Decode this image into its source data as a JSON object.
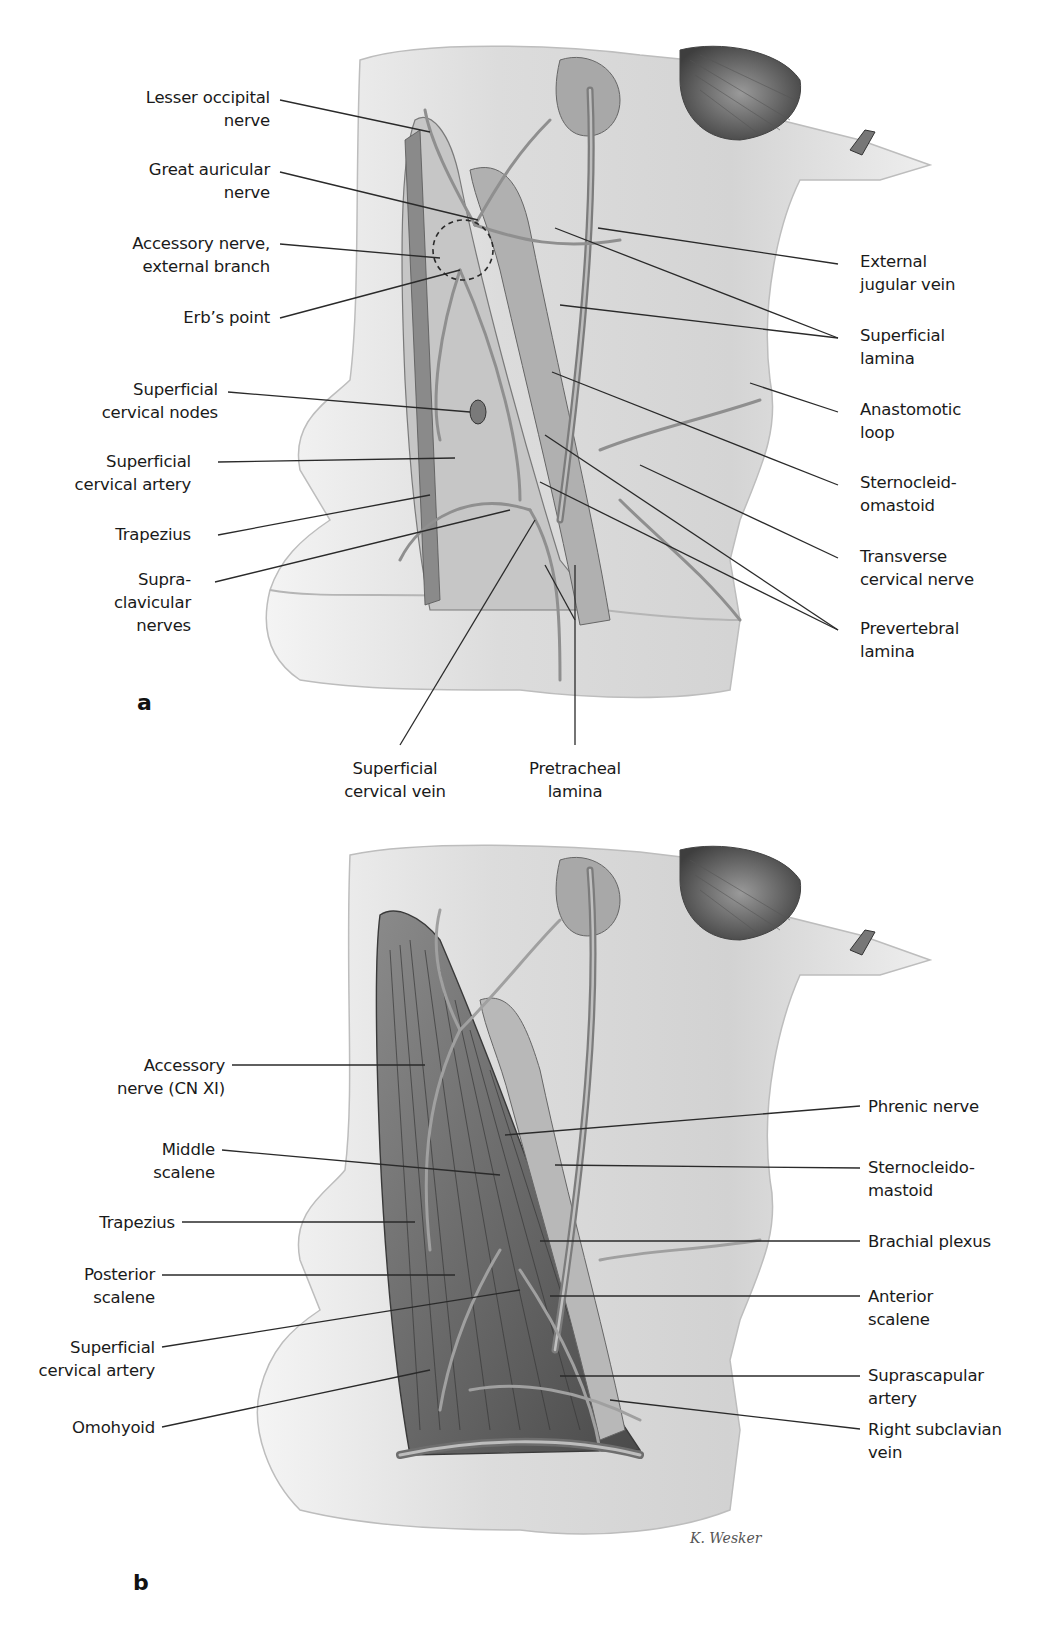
{
  "figure": {
    "panels": [
      {
        "id": "a",
        "letter": "a",
        "labels_left": [
          {
            "line1": "Lesser occipital",
            "line2": "nerve"
          },
          {
            "line1": "Great auricular",
            "line2": "nerve"
          },
          {
            "line1": "Accessory nerve,",
            "line2": "external branch"
          },
          {
            "line1": "Erb’s point",
            "line2": ""
          },
          {
            "line1": "Superficial",
            "line2": "cervical nodes"
          },
          {
            "line1": "Superficial",
            "line2": "cervical artery"
          },
          {
            "line1": "Trapezius",
            "line2": ""
          },
          {
            "line1": "Supra-",
            "line2": "clavicular",
            "line3": "nerves"
          }
        ],
        "labels_right": [
          {
            "line1": "External",
            "line2": "jugular vein"
          },
          {
            "line1": "Superficial",
            "line2": "lamina"
          },
          {
            "line1": "Anastomotic",
            "line2": "loop"
          },
          {
            "line1": "Sternocleid-",
            "line2": "omastoid"
          },
          {
            "line1": "Transverse",
            "line2": "cervical nerve"
          },
          {
            "line1": "Prevertebral",
            "line2": "lamina"
          }
        ],
        "labels_bottom": [
          {
            "line1": "Superficial",
            "line2": "cervical vein"
          },
          {
            "line1": "Pretracheal",
            "line2": "lamina"
          }
        ]
      },
      {
        "id": "b",
        "letter": "b",
        "labels_left": [
          {
            "line1": "Accessory",
            "line2": "nerve (CN XI)"
          },
          {
            "line1": "Middle",
            "line2": "scalene"
          },
          {
            "line1": "Trapezius",
            "line2": ""
          },
          {
            "line1": "Posterior",
            "line2": "scalene"
          },
          {
            "line1": "Superficial",
            "line2": "cervical artery"
          },
          {
            "line1": "Omohyoid",
            "line2": ""
          }
        ],
        "labels_right": [
          {
            "line1": "Phrenic nerve",
            "line2": ""
          },
          {
            "line1": "Sternocleido-",
            "line2": "mastoid"
          },
          {
            "line1": "Brachial plexus",
            "line2": ""
          },
          {
            "line1": "Anterior",
            "line2": "scalene"
          },
          {
            "line1": "Suprascapular",
            "line2": "artery"
          },
          {
            "line1": "Right subclavian",
            "line2": "vein"
          }
        ],
        "signature": "K. Wesker"
      }
    ],
    "colors": {
      "background": "#ffffff",
      "skin_light": "#ececec",
      "skin_mid": "#c9c9c9",
      "muscle_dark": "#6e6e6e",
      "vessel": "#8a8a8a",
      "leader_line": "#2a2a2a",
      "text": "#1a1a1a"
    }
  }
}
